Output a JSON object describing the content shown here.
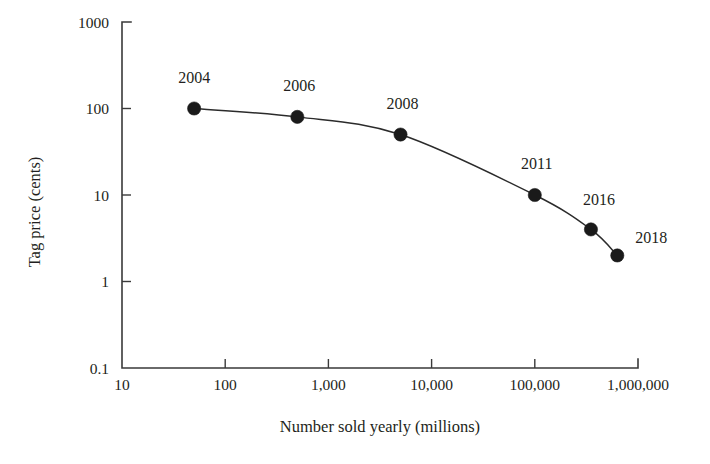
{
  "chart_data": {
    "type": "line",
    "title": "",
    "xlabel": "Number sold yearly (millions)",
    "ylabel": "Tag price (cents)",
    "xscale": "log",
    "yscale": "log",
    "xlim": [
      10,
      1000000
    ],
    "ylim": [
      0.1,
      1000
    ],
    "grid": false,
    "legend": "none",
    "x_tick_labels": [
      "10",
      "100",
      "1,000",
      "10,000",
      "100,000",
      "1,000,000"
    ],
    "x_tick_values": [
      10,
      100,
      1000,
      10000,
      100000,
      1000000
    ],
    "y_tick_labels": [
      "1000",
      "100",
      "10",
      "1",
      "0.1"
    ],
    "y_tick_values": [
      1000,
      100,
      10,
      1,
      0.1
    ],
    "series": [
      {
        "name": "RFID tag price vs volume",
        "points": [
          {
            "label": "2004",
            "x": 50,
            "y": 100
          },
          {
            "label": "2006",
            "x": 500,
            "y": 80
          },
          {
            "label": "2008",
            "x": 5000,
            "y": 50
          },
          {
            "label": "2011",
            "x": 100000,
            "y": 10
          },
          {
            "label": "2016",
            "x": 350000,
            "y": 4
          },
          {
            "label": "2018",
            "x": 630000,
            "y": 2
          }
        ]
      }
    ],
    "annotations": [
      "2004",
      "2006",
      "2008",
      "2011",
      "2016",
      "2018"
    ]
  },
  "geometry": {
    "plot_left": 122,
    "plot_right": 638,
    "plot_top": 22,
    "plot_bottom": 368,
    "x_decade_px": 103.2,
    "y_decade_px": 86.5
  },
  "point_label_offsets": [
    {
      "dx": 0,
      "dy": -26,
      "anchor": "middle"
    },
    {
      "dx": 2,
      "dy": -26,
      "anchor": "middle"
    },
    {
      "dx": 2,
      "dy": -26,
      "anchor": "middle"
    },
    {
      "dx": 2,
      "dy": -26,
      "anchor": "middle"
    },
    {
      "dx": 8,
      "dy": -24,
      "anchor": "middle"
    },
    {
      "dx": 34,
      "dy": -12,
      "anchor": "middle"
    }
  ]
}
